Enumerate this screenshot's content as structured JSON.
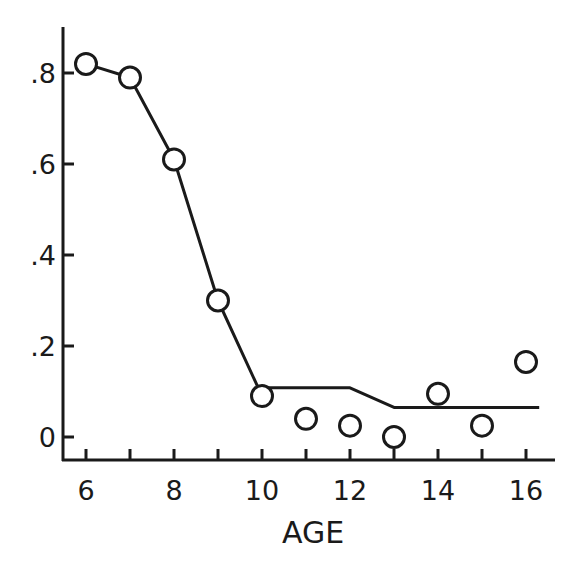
{
  "chart_data": {
    "type": "line",
    "title": "",
    "xlabel": "AGE",
    "ylabel": "",
    "xlim": [
      5.5,
      16.6
    ],
    "ylim": [
      -0.05,
      0.9
    ],
    "grid": false,
    "legend": null,
    "x_ticks": [
      6,
      7,
      8,
      9,
      10,
      11,
      12,
      13,
      14,
      15,
      16
    ],
    "x_tick_labels": [
      "6",
      "",
      "8",
      "",
      "10",
      "",
      "12",
      "",
      "14",
      "",
      "16"
    ],
    "y_ticks": [
      0,
      0.2,
      0.4,
      0.6,
      0.8
    ],
    "y_tick_labels": [
      "0",
      ".2",
      ".4",
      ".6",
      ".8"
    ],
    "series": [
      {
        "name": "observed",
        "style": "open-circle markers",
        "x": [
          6,
          7,
          8,
          9,
          10,
          11,
          12,
          13,
          14,
          15,
          16
        ],
        "values": [
          0.82,
          0.79,
          0.61,
          0.3,
          0.09,
          0.04,
          0.025,
          0.0,
          0.095,
          0.025,
          0.165
        ]
      },
      {
        "name": "fitted",
        "style": "solid line",
        "x": [
          6,
          7,
          8,
          9,
          10,
          10,
          12,
          13,
          16.3
        ],
        "values": [
          0.82,
          0.79,
          0.61,
          0.3,
          0.09,
          0.108,
          0.108,
          0.065,
          0.065
        ]
      }
    ]
  },
  "colors": {
    "ink": "#1a1a1a",
    "background": "#ffffff"
  }
}
